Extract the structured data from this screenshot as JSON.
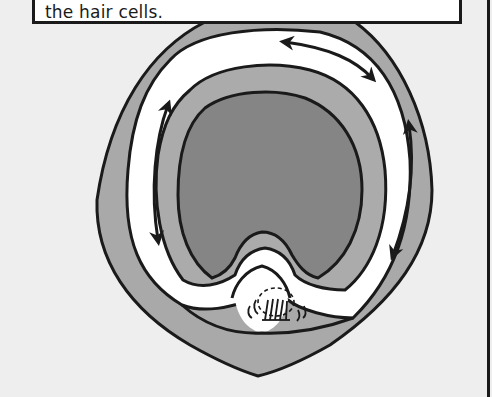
{
  "caption": {
    "text": "the hair cells."
  },
  "diagram": {
    "regions": [
      {
        "name": "outer-wall",
        "color": "#a9a9a9"
      },
      {
        "name": "fluid-channel",
        "color": "#ffffff"
      },
      {
        "name": "inner-membrane",
        "color": "#ababab"
      },
      {
        "name": "core",
        "color": "#858585"
      },
      {
        "name": "hair-cell-organ",
        "color": "#ffffff"
      }
    ],
    "arrows": [
      {
        "name": "top-bidirectional-arrow",
        "type": "double-headed"
      },
      {
        "name": "left-bidirectional-arrow",
        "type": "double-headed"
      },
      {
        "name": "right-bidirectional-arrow",
        "type": "double-headed"
      }
    ],
    "colors": {
      "background": "#eeeeee",
      "outline": "#1a1a1a"
    }
  }
}
